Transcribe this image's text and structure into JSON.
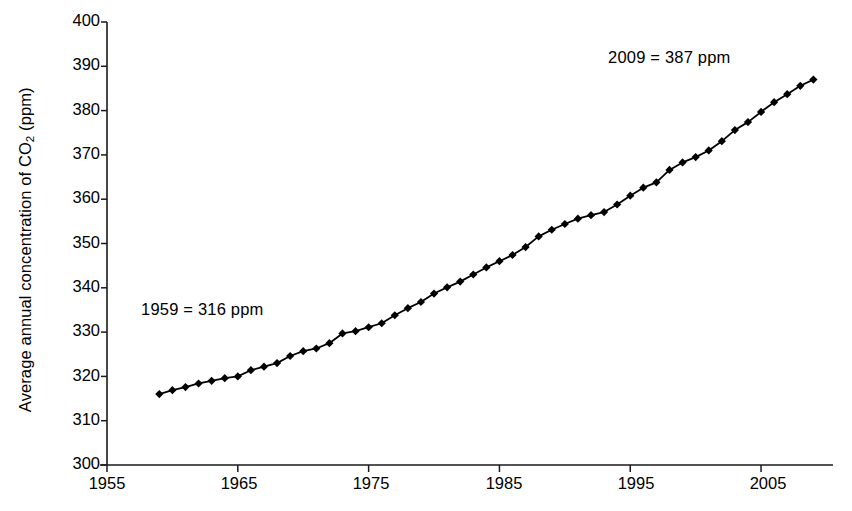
{
  "chart_data": {
    "type": "line",
    "title": "",
    "xlabel": "",
    "ylabel": "Average annual concentration of CO2 (ppm)",
    "ylabel_parts": {
      "before": "Average annual concentration of CO",
      "sub": "2",
      "after": " (ppm)"
    },
    "xlim": [
      1955,
      2010.5
    ],
    "ylim": [
      300,
      400
    ],
    "xticks": [
      1955,
      1965,
      1975,
      1985,
      1995,
      2005
    ],
    "yticks": [
      300,
      310,
      320,
      330,
      340,
      350,
      360,
      370,
      380,
      390,
      400
    ],
    "grid": false,
    "legend": "none",
    "marker": "diamond",
    "line_color": "#000000",
    "marker_color": "#000000",
    "x": [
      1959,
      1960,
      1961,
      1962,
      1963,
      1964,
      1965,
      1966,
      1967,
      1968,
      1969,
      1970,
      1971,
      1972,
      1973,
      1974,
      1975,
      1976,
      1977,
      1978,
      1979,
      1980,
      1981,
      1982,
      1983,
      1984,
      1985,
      1986,
      1987,
      1988,
      1989,
      1990,
      1991,
      1992,
      1993,
      1994,
      1995,
      1996,
      1997,
      1998,
      1999,
      2000,
      2001,
      2002,
      2003,
      2004,
      2005,
      2006,
      2007,
      2008,
      2009
    ],
    "values": [
      316.0,
      316.9,
      317.6,
      318.4,
      319.0,
      319.6,
      320.0,
      321.4,
      322.2,
      323.0,
      324.6,
      325.7,
      326.3,
      327.5,
      329.7,
      330.2,
      331.1,
      332.0,
      333.8,
      335.4,
      336.8,
      338.7,
      340.1,
      341.4,
      343.0,
      344.6,
      346.0,
      347.4,
      349.2,
      351.6,
      353.1,
      354.4,
      355.6,
      356.4,
      357.1,
      358.8,
      360.8,
      362.6,
      363.8,
      366.6,
      368.3,
      369.5,
      371.0,
      373.1,
      375.6,
      377.4,
      379.7,
      381.9,
      383.7,
      385.6,
      387.0
    ]
  },
  "annotations": [
    {
      "id": "start-point",
      "text": "1959 = 316 ppm",
      "x": 1959,
      "y": 316
    },
    {
      "id": "end-point",
      "text": "2009 = 387 ppm",
      "x": 2009,
      "y": 387
    }
  ],
  "axis_tick_labels": {
    "y": [
      "400",
      "390",
      "380",
      "370",
      "360",
      "350",
      "340",
      "330",
      "320",
      "310",
      "300"
    ],
    "x": [
      "1955",
      "1965",
      "1975",
      "1985",
      "1995",
      "2005"
    ]
  }
}
